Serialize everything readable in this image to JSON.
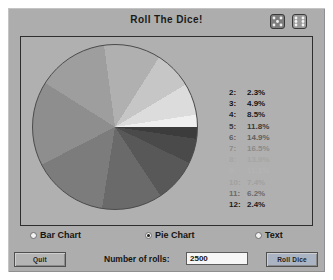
{
  "window": {
    "title": "Roll The Dice!",
    "bg_color": "#adadad"
  },
  "dice_icons": [
    {
      "name": "die-icon-left"
    },
    {
      "name": "die-icon-right"
    }
  ],
  "chart_data": {
    "type": "pie",
    "title": "Roll The Dice!",
    "xlabel": "",
    "ylabel": "",
    "legend_position": "right",
    "grid": false,
    "categories": [
      "2",
      "3",
      "4",
      "5",
      "6",
      "7",
      "8",
      "9",
      "10",
      "11",
      "12"
    ],
    "values": [
      2.3,
      4.9,
      8.5,
      11.8,
      14.9,
      16.5,
      13.9,
      11.1,
      7.4,
      6.2,
      2.4
    ],
    "labels": [
      "2.3%",
      "4.9%",
      "8.5%",
      "11.8%",
      "14.9%",
      "16.5%",
      "13.9%",
      "11.1%",
      "7.4%",
      "6.2%",
      "2.4%"
    ],
    "colors": [
      "#3c3c3c",
      "#4a4a4a",
      "#585858",
      "#6a6a6a",
      "#7c7c7c",
      "#8e8e8e",
      "#9e9e9e",
      "#b0b0b0",
      "#c6c6c6",
      "#dcdcdc",
      "#efefef"
    ],
    "legend": [
      {
        "key": "2:",
        "value": "2.3%",
        "color": "#121212"
      },
      {
        "key": "3:",
        "value": "4.9%",
        "color": "#121212"
      },
      {
        "key": "4:",
        "value": "8.5%",
        "color": "#1c1c1c"
      },
      {
        "key": "5:",
        "value": "11.8%",
        "color": "#3a3a3a"
      },
      {
        "key": "6:",
        "value": "14.9%",
        "color": "#5e5e5e"
      },
      {
        "key": "7:",
        "value": "16.5%",
        "color": "#8a8a8a"
      },
      {
        "key": "8:",
        "value": "13.9%",
        "color": "#a6a6a6"
      },
      {
        "key": "9:",
        "value": "11.1%",
        "color": "#b4b4b4"
      },
      {
        "key": "10:",
        "value": "7.4%",
        "color": "#a0a0a0"
      },
      {
        "key": "11:",
        "value": "6.2%",
        "color": "#6a6a6a"
      },
      {
        "key": "12:",
        "value": "2.4%",
        "color": "#1a1a1a"
      }
    ]
  },
  "view_options": {
    "items": [
      {
        "label": "Bar Chart",
        "selected": false
      },
      {
        "label": "Pie Chart",
        "selected": true
      },
      {
        "label": "Text",
        "selected": false
      }
    ]
  },
  "controls": {
    "quit_label": "Quit",
    "roll_label": "Roll Dice",
    "rolls_label": "Number of rolls:",
    "rolls_value": "2500",
    "rolls_placeholder": ""
  }
}
